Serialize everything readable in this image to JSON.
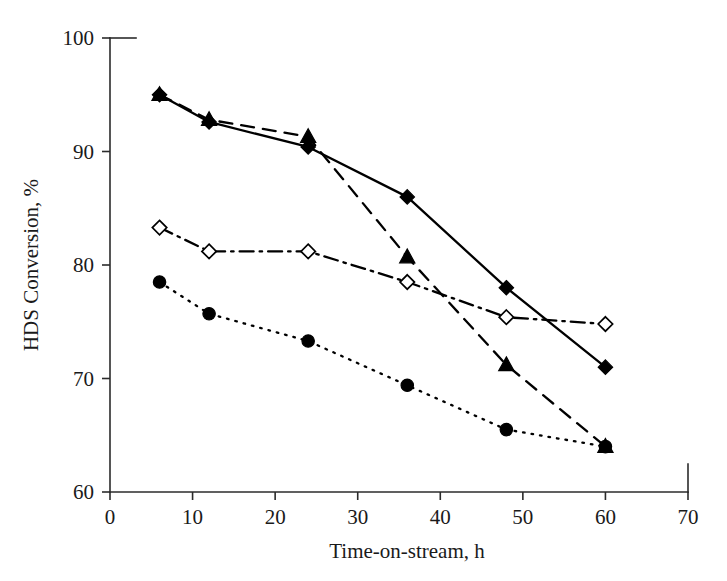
{
  "chart_data": {
    "type": "line",
    "title": "",
    "xlabel": "Time-on-stream, h",
    "ylabel": "HDS Conversion, %",
    "x": [
      6,
      12,
      24,
      36,
      48,
      60
    ],
    "xlim": [
      0,
      70
    ],
    "ylim": [
      60,
      100
    ],
    "xticks": [
      0,
      10,
      20,
      30,
      40,
      50,
      60,
      70
    ],
    "yticks": [
      60,
      70,
      80,
      90,
      100
    ],
    "xtick_labels": [
      "0",
      "10",
      "20",
      "30",
      "40",
      "50",
      "60",
      "70"
    ],
    "ytick_labels": [
      "60",
      "70",
      "80",
      "90",
      "100"
    ],
    "grid": false,
    "legend": "none",
    "series": [
      {
        "name": "series-filled-diamond",
        "marker": "filled-diamond",
        "linestyle": "solid",
        "color": "#000000",
        "values": [
          95.0,
          92.6,
          90.4,
          86.0,
          78.0,
          71.0
        ]
      },
      {
        "name": "series-filled-triangle",
        "marker": "filled-triangle",
        "linestyle": "dashed",
        "color": "#000000",
        "values": [
          95.0,
          92.8,
          91.3,
          80.7,
          71.2,
          64.0
        ]
      },
      {
        "name": "series-open-diamond",
        "marker": "open-diamond",
        "linestyle": "dash-dot",
        "color": "#000000",
        "values": [
          83.3,
          81.2,
          81.2,
          78.5,
          75.4,
          74.8
        ]
      },
      {
        "name": "series-filled-circle",
        "marker": "filled-circle",
        "linestyle": "dotted",
        "color": "#000000",
        "values": [
          78.5,
          75.7,
          73.3,
          69.4,
          65.5,
          64.0
        ]
      }
    ]
  }
}
